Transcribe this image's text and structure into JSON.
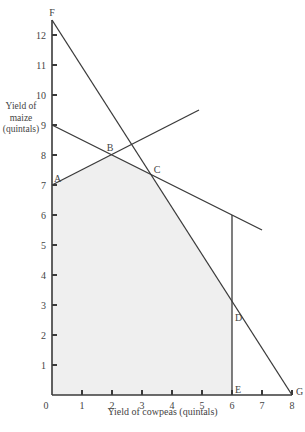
{
  "chart_data": {
    "type": "line",
    "title": "",
    "xlabel": "Yield of cowpeas (quintals)",
    "ylabel": "Yield of maize (quintals)",
    "ylabel_lines": [
      "Yield of",
      "maize",
      "(quintals)"
    ],
    "xlim": [
      0,
      8
    ],
    "ylim": [
      0,
      12.5
    ],
    "grid": false,
    "x_ticks": [
      1,
      2,
      3,
      4,
      5,
      6,
      7,
      8
    ],
    "x_tick_labels": [
      "0",
      "1",
      "2",
      "3",
      "4",
      "5",
      "6",
      "7",
      "8"
    ],
    "y_ticks": [
      1,
      2,
      3,
      4,
      5,
      6,
      7,
      8,
      9,
      10,
      11,
      12
    ],
    "y_tick_labels": [
      "1",
      "2",
      "3",
      "4",
      "5",
      "6",
      "7",
      "8",
      "9",
      "10",
      "11",
      "12"
    ],
    "series": [
      {
        "name": "Constraint F-G",
        "points": [
          [
            0,
            12.5
          ],
          [
            8,
            0
          ]
        ]
      },
      {
        "name": "Constraint through B and C",
        "points": [
          [
            0,
            9
          ],
          [
            7,
            5.5
          ]
        ]
      },
      {
        "name": "Constraint A-B",
        "points": [
          [
            0,
            7
          ],
          [
            4.9,
            9.5
          ]
        ]
      },
      {
        "name": "Constraint E (cowpeas = 6)",
        "points": [
          [
            6,
            0
          ],
          [
            6,
            6
          ]
        ]
      }
    ],
    "feasible_region": {
      "fill": "#efefef",
      "points": [
        [
          0,
          0
        ],
        [
          0,
          7
        ],
        [
          2,
          8
        ],
        [
          3.29,
          7.35
        ],
        [
          6,
          3.125
        ],
        [
          6,
          0
        ]
      ]
    },
    "annotations": [
      {
        "text": "F",
        "x": 0,
        "y": 12.5
      },
      {
        "text": "A",
        "x": 0,
        "y": 7
      },
      {
        "text": "B",
        "x": 2,
        "y": 8
      },
      {
        "text": "C",
        "x": 3.29,
        "y": 7.35
      },
      {
        "text": "D",
        "x": 6,
        "y": 3.125
      },
      {
        "text": "E",
        "x": 6,
        "y": 0
      },
      {
        "text": "G",
        "x": 8,
        "y": 0
      }
    ]
  },
  "colors": {
    "line": "#3a3a3a",
    "fill": "#efefef",
    "text": "#444444"
  }
}
